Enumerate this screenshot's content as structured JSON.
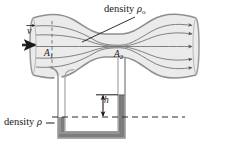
{
  "figure": {
    "type": "venturi-flow-meter-diagram",
    "labels": {
      "density_pipe": "density",
      "density_pipe_symbol": "ρ",
      "density_pipe_subscript": "o",
      "density_manometer": "density",
      "density_manometer_symbol": "ρ",
      "area_inlet": "A",
      "area_inlet_subscript": "1",
      "area_throat": "A",
      "area_throat_subscript": "2",
      "height_difference": "h",
      "velocity": "v"
    },
    "colors": {
      "outline": "#8a8a8a",
      "pipe_fill": "#ebebeb",
      "streamline": "#6e6e6e",
      "manometer_fluid": "#7d7d7d",
      "manometer_fluid_light": "#9a9a9a",
      "tube_wall": "#8f8f8f",
      "text": "#1a1a1a",
      "dashed_line": "#3a3a3a",
      "background": "#ffffff"
    },
    "streamline_count": 5,
    "inlet_arrow_count": 1,
    "outlet_arrow_count": 5,
    "manometer": {
      "left_column_level": "low",
      "right_column_level": "high",
      "difference_label": "h",
      "reference_line_style": "dashed"
    }
  }
}
